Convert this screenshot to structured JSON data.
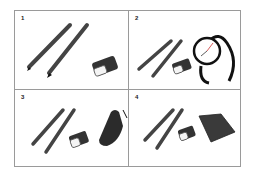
{
  "panels": [
    {
      "number": "1",
      "items": [
        "pencil",
        "pencil",
        "eraser"
      ]
    },
    {
      "number": "2",
      "items": [
        "pencil",
        "pencil",
        "eraser",
        "wristwatch"
      ]
    },
    {
      "number": "3",
      "items": [
        "pencil",
        "pencil",
        "eraser",
        "flip-phone"
      ]
    },
    {
      "number": "4",
      "items": [
        "pencil",
        "pencil",
        "eraser",
        "notepad"
      ]
    }
  ]
}
